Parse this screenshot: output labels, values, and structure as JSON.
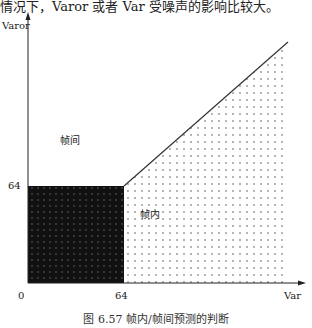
{
  "header_text": "情况下，Varor 或者 Var 受噪声的影响比较大。",
  "diagram": {
    "y_axis_label": "Varor",
    "x_axis_label": "Var",
    "origin_label": "0",
    "y_tick_label": "64",
    "x_tick_label": "64",
    "region_inter_label": "帧间",
    "region_intra_label": "帧内",
    "colors": {
      "dark_region": "#111111",
      "dots": "#555555",
      "line": "#333333"
    }
  },
  "caption": "图 6.57   帧内/帧间预测的判断"
}
